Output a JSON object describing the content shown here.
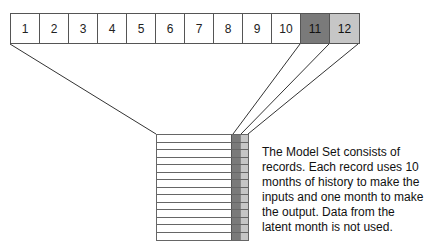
{
  "months": [
    {
      "label": "1",
      "role": "input"
    },
    {
      "label": "2",
      "role": "input"
    },
    {
      "label": "3",
      "role": "input"
    },
    {
      "label": "4",
      "role": "input"
    },
    {
      "label": "5",
      "role": "input"
    },
    {
      "label": "6",
      "role": "input"
    },
    {
      "label": "7",
      "role": "input"
    },
    {
      "label": "8",
      "role": "input"
    },
    {
      "label": "9",
      "role": "input"
    },
    {
      "label": "10",
      "role": "input"
    },
    {
      "label": "11",
      "role": "output"
    },
    {
      "label": "12",
      "role": "latent"
    }
  ],
  "colors": {
    "output": "#7a7a7a",
    "latent": "#c6c6c6",
    "input": "#ffffff",
    "border": "#555555"
  },
  "record_count": 14,
  "caption": "The Model Set consists of records.  Each record uses 10 months of history to make the inputs and one month to make the output.  Data from the latent month is not used."
}
